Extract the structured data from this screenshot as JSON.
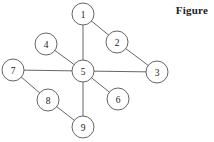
{
  "caption": {
    "text": "Figure"
  },
  "colors": {
    "background": "#ffffff",
    "stroke": "#555555",
    "node_fill": "#ffffff",
    "label": "#1a1a1a",
    "caption": "#222222"
  },
  "chart_data": {
    "type": "diagram",
    "title": "Figure",
    "layout": "node-link graph, star/hub topology centered on node 5",
    "nodes": [
      {
        "id": "1",
        "label": "1",
        "x": 83,
        "y": 14,
        "r": 11
      },
      {
        "id": "2",
        "label": "2",
        "x": 117,
        "y": 42,
        "r": 11
      },
      {
        "id": "3",
        "label": "3",
        "x": 157,
        "y": 72,
        "r": 11
      },
      {
        "id": "4",
        "label": "4",
        "x": 46,
        "y": 44,
        "r": 11
      },
      {
        "id": "5",
        "label": "5",
        "x": 83,
        "y": 71,
        "r": 11
      },
      {
        "id": "6",
        "label": "6",
        "x": 118,
        "y": 99,
        "r": 11
      },
      {
        "id": "7",
        "label": "7",
        "x": 13,
        "y": 70,
        "r": 11
      },
      {
        "id": "8",
        "label": "8",
        "x": 48,
        "y": 100,
        "r": 11
      },
      {
        "id": "9",
        "label": "9",
        "x": 83,
        "y": 127,
        "r": 11
      }
    ],
    "edges": [
      {
        "source": "5",
        "target": "1"
      },
      {
        "source": "1",
        "target": "2"
      },
      {
        "source": "2",
        "target": "3"
      },
      {
        "source": "5",
        "target": "3"
      },
      {
        "source": "5",
        "target": "4"
      },
      {
        "source": "5",
        "target": "6"
      },
      {
        "source": "5",
        "target": "7"
      },
      {
        "source": "7",
        "target": "8"
      },
      {
        "source": "8",
        "target": "9"
      },
      {
        "source": "5",
        "target": "9"
      }
    ]
  }
}
